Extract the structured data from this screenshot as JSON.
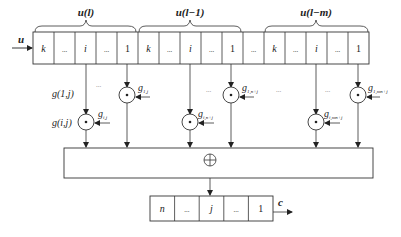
{
  "input_label": "u",
  "output_label": "c",
  "sum_symbol": "⊕",
  "mult_symbol": "•",
  "top_register": {
    "groups": [
      {
        "label": "u(l)",
        "cells": [
          "k",
          "...",
          "i",
          "...",
          "1"
        ]
      },
      {
        "label": "u(l−1)",
        "cells": [
          "k",
          "...",
          "i",
          "...",
          "1"
        ]
      },
      {
        "gap": "..."
      },
      {
        "label": "u(l−m)",
        "cells": [
          "k",
          "...",
          "i",
          "...",
          "1"
        ]
      }
    ],
    "flat_cells": [
      "k",
      "...",
      "i",
      "...",
      "1",
      "k",
      "...",
      "i",
      "...",
      "1",
      "...",
      "k",
      "...",
      "i",
      "...",
      "1"
    ]
  },
  "side_labels": {
    "g1j": "g(1,j)",
    "gij": "g(i,j)"
  },
  "multipliers": [
    {
      "tap": "g_{1,j}",
      "text": "g",
      "sub": "1,j",
      "row": "upper"
    },
    {
      "tap": "g_{i,j}",
      "text": "g",
      "sub": "i,j",
      "row": "lower"
    },
    {
      "tap": "g_{1,n+j}",
      "text": "g",
      "sub": "1,n+j",
      "row": "upper"
    },
    {
      "tap": "g_{i,n+j}",
      "text": "g",
      "sub": "i,n+j",
      "row": "lower"
    },
    {
      "tap": "g_{1,mn+j}",
      "text": "g",
      "sub": "1,mn+j",
      "row": "upper"
    },
    {
      "tap": "g_{i,mn+j}",
      "text": "g",
      "sub": "i,mn+j",
      "row": "lower"
    }
  ],
  "ellipses": [
    "...",
    "...",
    "...",
    "...",
    "..."
  ],
  "output_register": {
    "cells": [
      "n",
      "...",
      "j",
      "...",
      "1"
    ]
  }
}
